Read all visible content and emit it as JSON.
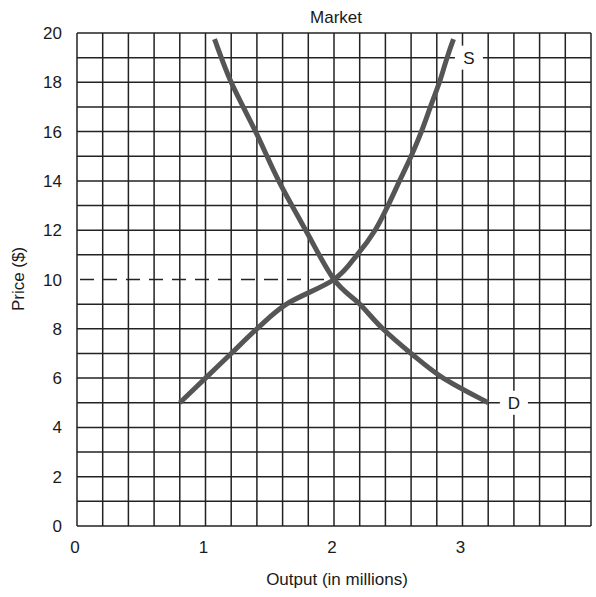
{
  "chart_data": {
    "type": "line",
    "title": "Market",
    "xlabel": "Output (in millions)",
    "ylabel": "Price ($)",
    "xlim": [
      0,
      4
    ],
    "ylim": [
      0,
      20
    ],
    "x_ticks": [
      "0",
      "1",
      "2",
      "3"
    ],
    "x_tick_values": [
      0,
      1,
      2,
      3
    ],
    "y_ticks": [
      "0",
      "2",
      "4",
      "6",
      "8",
      "10",
      "12",
      "14",
      "16",
      "18",
      "20"
    ],
    "y_tick_values": [
      0,
      2,
      4,
      6,
      8,
      10,
      12,
      14,
      16,
      18,
      20
    ],
    "grid": true,
    "grid_x_step": 0.2,
    "grid_y_step": 1,
    "series": [
      {
        "name": "D",
        "label": "D",
        "kind": "demand",
        "x": [
          1.07,
          1.2,
          1.39,
          1.57,
          1.78,
          2.0,
          2.2,
          2.38,
          2.6,
          2.85,
          3.2
        ],
        "y": [
          19.75,
          18,
          16,
          14,
          12,
          10,
          9,
          8,
          7,
          6,
          5
        ]
      },
      {
        "name": "S",
        "label": "S",
        "kind": "supply",
        "x": [
          0.8,
          1.0,
          1.2,
          1.4,
          1.63,
          2.0,
          2.18,
          2.32,
          2.42,
          2.51,
          2.6,
          2.68,
          2.75,
          2.82,
          2.88,
          2.93
        ],
        "y": [
          5,
          6,
          7,
          8,
          9,
          10,
          11,
          12,
          13,
          14,
          15,
          16,
          17,
          18,
          19,
          19.75
        ]
      }
    ],
    "annotations": [
      {
        "type": "dashed-hline",
        "y": 10,
        "x_from": 0,
        "x_to": 2,
        "note": "equilibrium price"
      },
      {
        "type": "label",
        "text": "S",
        "x": 3.05,
        "y": 19
      },
      {
        "type": "label",
        "text": "D",
        "x": 3.4,
        "y": 5
      }
    ],
    "equilibrium": {
      "quantity": 2,
      "price": 10
    },
    "colors": {
      "curve": "#555555",
      "grid": "#222222",
      "text": "#1a1a1a"
    }
  }
}
